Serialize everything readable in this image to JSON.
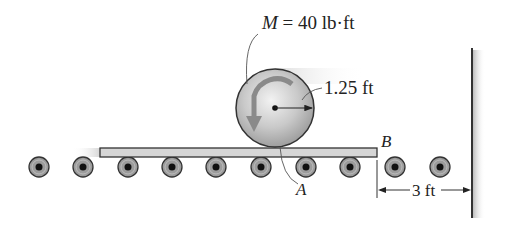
{
  "diagram": {
    "type": "engineering-mechanics-figure",
    "labels": {
      "moment_symbol": "M",
      "moment_value": " = 40 lb·ft",
      "radius": "1.25 ft",
      "point_a": "A",
      "point_b": "B",
      "distance": "3 ft"
    },
    "disc": {
      "center_x": 275,
      "center_y": 108,
      "radius": 39,
      "description": "uniform disc with counterclockwise couple moment"
    },
    "plank": {
      "x": 100,
      "y": 148,
      "width": 277,
      "height": 9
    },
    "rollers": {
      "count": 10,
      "y": 167,
      "radius": 10,
      "x_positions": [
        39,
        83,
        128,
        172,
        216,
        261,
        306,
        350,
        395,
        440
      ]
    },
    "wall": {
      "x": 472,
      "y_top": 48,
      "y_bottom": 218
    },
    "colors": {
      "ink": "#2a2a2a",
      "disc_light": "#e6e6e6",
      "disc_dark": "#9a9a9a",
      "plank_fill": "#d6d6d6",
      "roller_fill": "#9c9c9c",
      "arrow_fill": "#8a8a8a"
    }
  }
}
